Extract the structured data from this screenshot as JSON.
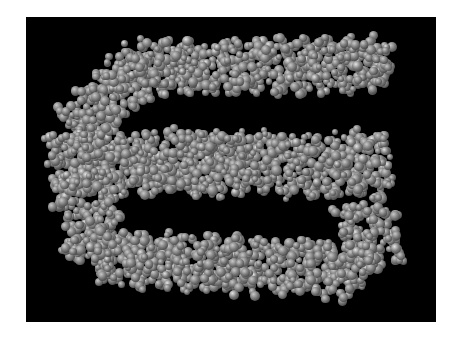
{
  "image": {
    "subject": "space-filling molecular model of a supercoiled DNA-like double helix folded into an S-shape",
    "background_color": "#000000",
    "border_color": "#ffffff",
    "atom_colors": {
      "highlight": "#c8c8c8",
      "mid": "#7a7a7a",
      "shadow": "#262626"
    }
  },
  "frame": {
    "left": 26,
    "top": 17,
    "width": 410,
    "height": 305
  },
  "helix_segments": [
    {
      "name": "top-strand",
      "from": [
        115,
        50
      ],
      "to": [
        365,
        48
      ],
      "thickness": 58,
      "period": 46
    },
    {
      "name": "left-top-bend",
      "from": [
        120,
        45
      ],
      "to": [
        50,
        115
      ],
      "thickness": 62,
      "period": 46
    },
    {
      "name": "left-bend",
      "from": [
        50,
        115
      ],
      "to": [
        60,
        175
      ],
      "thickness": 70,
      "period": 46
    },
    {
      "name": "middle-strand",
      "from": [
        55,
        145
      ],
      "to": [
        365,
        148
      ],
      "thickness": 70,
      "period": 46
    },
    {
      "name": "left-low-bend",
      "from": [
        55,
        160
      ],
      "to": [
        70,
        240
      ],
      "thickness": 66,
      "period": 46
    },
    {
      "name": "bottom-strand",
      "from": [
        70,
        240
      ],
      "to": [
        340,
        255
      ],
      "thickness": 60,
      "period": 46
    },
    {
      "name": "right-low-bend",
      "from": [
        335,
        185
      ],
      "to": [
        355,
        250
      ],
      "thickness": 62,
      "period": 46
    }
  ]
}
